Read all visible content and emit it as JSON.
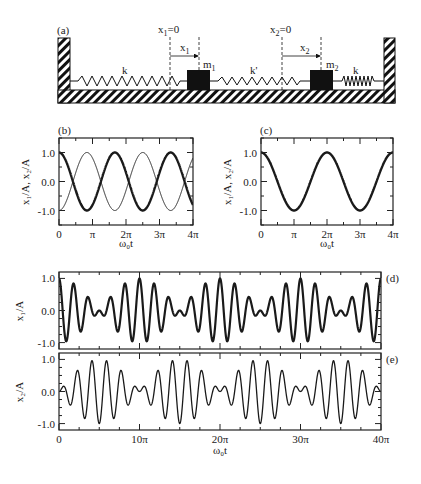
{
  "figure": {
    "panel_labels": {
      "a": "(a)",
      "b": "(b)",
      "c": "(c)",
      "d": "(d)",
      "e": "(e)"
    },
    "diagram": {
      "x1_zero": "x",
      "x1_zero_sub": "1",
      "x1_zero_suffix": "=0",
      "x1_arrow": "x",
      "x1_arrow_sub": "1",
      "x2_zero": "x",
      "x2_zero_sub": "2",
      "x2_zero_suffix": "=0",
      "x2_arrow": "x",
      "x2_arrow_sub": "2",
      "spring_left": "k",
      "spring_middle": "k'",
      "spring_right": "k",
      "mass1": "m",
      "mass1_sub": "1",
      "mass2": "m",
      "mass2_sub": "2"
    },
    "ylabel_bc": "x₁/A, x₂/A",
    "ylabel_d": "x₁/A",
    "ylabel_e": "x₂/A",
    "xlabel": "ω₀t"
  },
  "chart_data": [
    {
      "panel": "b",
      "type": "line",
      "xlabel": "ω₀t",
      "ylabel": "x₁/A, x₂/A",
      "xlim": [
        0,
        12.566
      ],
      "ylim": [
        -1.5,
        1.5
      ],
      "xticks": [
        "0",
        "π",
        "2π",
        "3π",
        "4π"
      ],
      "yticks": [
        "1.0",
        "0.0",
        "-1.0"
      ],
      "series": [
        {
          "name": "x1/A (thick)",
          "formula": "cos(1.2 ω0 t)",
          "amp": [
            1.0
          ],
          "freq": [
            1.2
          ],
          "width": 2.4
        },
        {
          "name": "x2/A (thin)",
          "formula": "-cos(1.2 ω0 t)",
          "amp": [
            -1.0
          ],
          "freq": [
            1.2
          ],
          "width": 1.0
        }
      ]
    },
    {
      "panel": "c",
      "type": "line",
      "xlabel": "ω₀t",
      "ylabel": "x₁/A, x₂/A",
      "xlim": [
        0,
        12.566
      ],
      "ylim": [
        -1.5,
        1.5
      ],
      "xticks": [
        "0",
        "π",
        "2π",
        "3π",
        "4π"
      ],
      "yticks": [
        "1.0",
        "0.0",
        "-1.0"
      ],
      "series": [
        {
          "name": "x1/A = x2/A",
          "formula": "cos(ω0 t)",
          "amp": [
            1.0
          ],
          "freq": [
            1.0
          ],
          "width": 2.4
        }
      ]
    },
    {
      "panel": "d",
      "type": "line",
      "xlabel": "",
      "ylabel": "x₁/A",
      "xlim": [
        0,
        125.66
      ],
      "ylim": [
        -1.2,
        1.2
      ],
      "xticks": [],
      "yticks": [
        "1.0",
        "0.0",
        "-1.0"
      ],
      "series": [
        {
          "name": "x1/A",
          "formula": "0.5[cos(ω0 t)+cos(1.2 ω0 t)]",
          "amp": [
            0.5,
            0.5
          ],
          "freq": [
            1.0,
            1.2
          ],
          "width": 2.2
        }
      ]
    },
    {
      "panel": "e",
      "type": "line",
      "xlabel": "ω₀t",
      "ylabel": "x₂/A",
      "xlim": [
        0,
        125.66
      ],
      "ylim": [
        -1.2,
        1.2
      ],
      "xticks": [
        "0",
        "10π",
        "20π",
        "30π",
        "40π"
      ],
      "yticks": [
        "1.0",
        "0.0",
        "-1.0"
      ],
      "series": [
        {
          "name": "x2/A",
          "formula": "0.5[cos(ω0 t)-cos(1.2 ω0 t)]",
          "amp": [
            0.5,
            -0.5
          ],
          "freq": [
            1.0,
            1.2
          ],
          "width": 1.3
        }
      ]
    }
  ]
}
